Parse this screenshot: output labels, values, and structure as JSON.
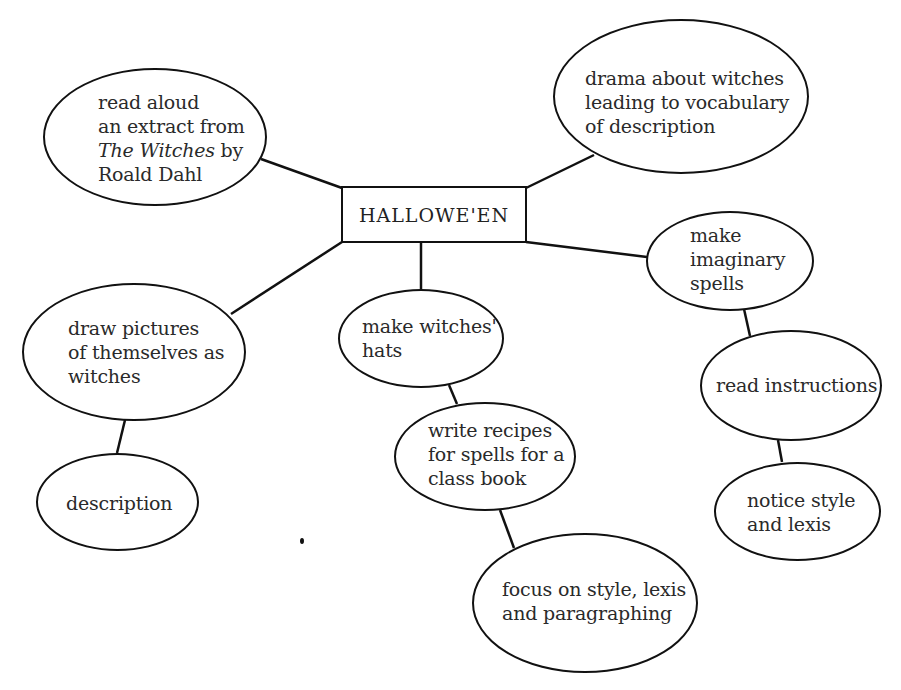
{
  "diagram": {
    "type": "mind-map",
    "center": {
      "id": "hallowen",
      "label": "HALLOWE'EN"
    },
    "nodes": {
      "read_aloud": {
        "lines": [
          "read aloud",
          "an extract from",
          "The Witches",
          " by",
          "Roald Dahl"
        ],
        "italic_title": "The Witches"
      },
      "drama": {
        "lines": [
          "drama about witches",
          "leading to vocabulary",
          "of description"
        ]
      },
      "imaginary_spells": {
        "lines": [
          "make",
          "imaginary",
          "spells"
        ]
      },
      "draw_pictures": {
        "lines": [
          "draw pictures",
          "of themselves as",
          "witches"
        ]
      },
      "witches_hats": {
        "lines": [
          "make witches'",
          "hats"
        ]
      },
      "read_instructions": {
        "lines": [
          "read instructions"
        ]
      },
      "description": {
        "lines": [
          "description"
        ]
      },
      "write_recipes": {
        "lines": [
          "write recipes",
          "for spells for a",
          "class book"
        ]
      },
      "notice_style": {
        "lines": [
          "notice style",
          "and lexis"
        ]
      },
      "focus_style": {
        "lines": [
          "focus on style, lexis",
          "and paragraphing"
        ]
      }
    },
    "edges": [
      [
        "hallowen",
        "read_aloud"
      ],
      [
        "hallowen",
        "drama"
      ],
      [
        "hallowen",
        "imaginary_spells"
      ],
      [
        "hallowen",
        "draw_pictures"
      ],
      [
        "hallowen",
        "witches_hats"
      ],
      [
        "draw_pictures",
        "description"
      ],
      [
        "witches_hats",
        "write_recipes"
      ],
      [
        "write_recipes",
        "focus_style"
      ],
      [
        "imaginary_spells",
        "read_instructions"
      ],
      [
        "read_instructions",
        "notice_style"
      ]
    ]
  }
}
